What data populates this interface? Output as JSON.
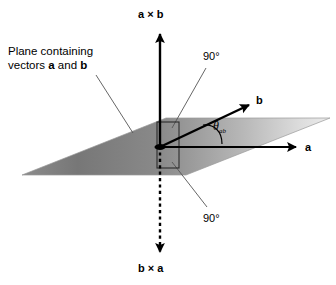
{
  "figure": {
    "background_color": "#ffffff",
    "line_color": "#000000",
    "plane_dark": "#6e6e6e",
    "plane_light": "#e2e2e2",
    "leader_color": "#555555"
  },
  "labels": {
    "top_axis": "a × b",
    "bottom_axis": "b × a",
    "vector_a": "a",
    "vector_b": "b",
    "angle_theta": "θ",
    "angle_theta_sub": "ab",
    "right_angle_upper": "90°",
    "right_angle_lower": "90°",
    "plane_note_line1": "Plane containing",
    "plane_note_line2_pre": "vectors ",
    "plane_note_line2_a": "a",
    "plane_note_line2_mid": " and ",
    "plane_note_line2_b": "b"
  },
  "icons": {
    "arrow_up": "arrow-up-icon",
    "arrow_down_dashed": "arrow-down-dashed-icon",
    "arrow_right": "arrow-right-icon",
    "arrow_diagonal": "arrow-diagonal-icon",
    "right_angle_marker": "right-angle-marker-icon",
    "angle_arc": "angle-arc-icon"
  },
  "geometry": {
    "origin_x": 160,
    "origin_y": 146,
    "axis_top_y": 30,
    "axis_bottom_y": 258,
    "vector_a_tip_x": 300,
    "vector_b_tip_x": 252,
    "vector_b_tip_y": 102
  }
}
